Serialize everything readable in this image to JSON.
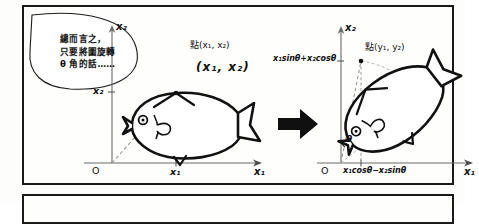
{
  "figure": {
    "speech_bubble": {
      "name": "speech-bubble",
      "line1": "總而言之，",
      "line2": "只要將圖旋轉",
      "line3": "θ 角的話……"
    },
    "arrow": {
      "name": "transform-arrow",
      "symbol": "right-arrow-icon"
    },
    "left_panel": {
      "name": "original-figure-panel",
      "y_axis_label": "x₂",
      "x_axis_label": "x₁",
      "origin_label": "O",
      "y_tick_label": "x₂",
      "x_tick_label": "x₁",
      "point_label_printed": "點(x₁, x₂)",
      "point_label_hand": "(x₁, x₂)",
      "subject": "fish-drawing"
    },
    "right_panel": {
      "name": "rotated-figure-panel",
      "y_axis_label": "x₂",
      "x_axis_label": "x₁",
      "origin_label": "O",
      "y_tick_label": "x₁sinθ+x₂cosθ",
      "x_tick_label": "x₁cosθ−x₂sinθ",
      "point_label_printed": "點(y₁, y₂)",
      "angle_label": "θ",
      "subject": "rotated-fish-drawing"
    },
    "colors": {
      "ink": "#141414",
      "axis": "#555555",
      "paper": "#fdfdfb",
      "dashed": "#8a8a8a"
    }
  }
}
